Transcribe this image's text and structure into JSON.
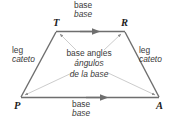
{
  "figure": {
    "shape": "trapezoid",
    "stroke_color": "#6e6e6e",
    "leader_color": "#b0b0b0",
    "text_color": "#3a3a3a",
    "vertex_color": "#1c1c1c",
    "background": "#ffffff"
  },
  "vertices": [
    {
      "id": "T",
      "label": "T",
      "x": 56,
      "y": 29
    },
    {
      "id": "R",
      "label": "R",
      "x": 124,
      "y": 29
    },
    {
      "id": "A",
      "label": "A",
      "x": 160,
      "y": 99
    },
    {
      "id": "P",
      "label": "P",
      "x": 18,
      "y": 99
    }
  ],
  "labels": {
    "top_base": {
      "en": "base",
      "es": "base"
    },
    "bottom_base": {
      "en": "base",
      "es": "base"
    },
    "left_leg": {
      "en": "leg",
      "es": "cateto"
    },
    "right_leg": {
      "en": "leg",
      "es": "cateto"
    },
    "base_angles": {
      "en": "base angles",
      "es_line1": "ángulos",
      "es_line2": "de la base"
    }
  },
  "markings": {
    "parallel_arrows": 2,
    "leader_lines": 4
  }
}
